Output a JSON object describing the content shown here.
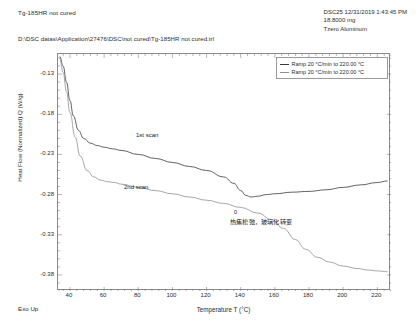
{
  "header": {
    "sample_title": "Tg-185HR not cured",
    "instrument_line": "DSC25 12/31/2019 1:43:45 PM",
    "mass_line": "18.8000 mg",
    "pan_line": "Tzero Aluminum",
    "file_path": "D:\\DSC datas\\Application\\27476\\DSC\\not cured\\Tg-185HR not cured.trl"
  },
  "legend": {
    "position": "top-right",
    "entries": [
      {
        "label": "Ramp 20 °C/min to 220.00 °C",
        "color": "#3a3a3a"
      },
      {
        "label": "Ramp 20 °C/min to 220.00 °C",
        "color": "#8f8f8f"
      }
    ]
  },
  "annotations": {
    "scan1": "1st scan",
    "scan2": "2nd scan",
    "zero_marker": "0",
    "chinese_note": "热焦松弛，玻璃化转变"
  },
  "footer": {
    "exo_up": "Exo Up"
  },
  "chart_data": {
    "type": "line",
    "title": "Tg-185HR not cured",
    "xlabel": "Temperature T (°C)",
    "ylabel": "Heat Flow (Normalized) Q (W/g)",
    "xlim": [
      33,
      228
    ],
    "ylim": [
      -0.4,
      -0.105
    ],
    "xticks": [
      40,
      60,
      80,
      100,
      120,
      140,
      160,
      180,
      200,
      220
    ],
    "yticks": [
      -0.13,
      -0.18,
      -0.23,
      -0.28,
      -0.33,
      -0.38
    ],
    "grid": false,
    "series": [
      {
        "name": "1st scan",
        "legend": "Ramp 20 °C/min to 220.00 °C",
        "color": "#3a3a3a",
        "x": [
          34,
          36,
          38,
          40,
          42,
          45,
          48,
          52,
          56,
          60,
          65,
          70,
          80,
          90,
          100,
          110,
          120,
          130,
          136,
          140,
          143,
          146,
          150,
          155,
          160,
          170,
          180,
          190,
          200,
          210,
          220,
          226
        ],
        "y": [
          -0.108,
          -0.12,
          -0.14,
          -0.163,
          -0.182,
          -0.2,
          -0.21,
          -0.216,
          -0.219,
          -0.221,
          -0.223,
          -0.225,
          -0.23,
          -0.235,
          -0.24,
          -0.245,
          -0.25,
          -0.258,
          -0.266,
          -0.275,
          -0.281,
          -0.283,
          -0.282,
          -0.28,
          -0.279,
          -0.277,
          -0.276,
          -0.274,
          -0.271,
          -0.268,
          -0.265,
          -0.263
        ]
      },
      {
        "name": "2nd scan",
        "legend": "Ramp 20 °C/min to 220.00 °C",
        "color": "#8f8f8f",
        "x": [
          34,
          36,
          38,
          40,
          43,
          46,
          50,
          54,
          58,
          62,
          66,
          70,
          80,
          90,
          100,
          110,
          120,
          130,
          140,
          150,
          158,
          165,
          172,
          178,
          185,
          192,
          200,
          208,
          215,
          220,
          226
        ],
        "y": [
          -0.11,
          -0.128,
          -0.152,
          -0.178,
          -0.208,
          -0.232,
          -0.25,
          -0.258,
          -0.262,
          -0.264,
          -0.265,
          -0.267,
          -0.271,
          -0.275,
          -0.279,
          -0.283,
          -0.287,
          -0.291,
          -0.296,
          -0.303,
          -0.311,
          -0.322,
          -0.336,
          -0.348,
          -0.358,
          -0.364,
          -0.369,
          -0.372,
          -0.374,
          -0.375,
          -0.376
        ]
      }
    ],
    "markers": [
      {
        "label": "0",
        "x": 141,
        "y": -0.281,
        "series": "1st scan"
      }
    ],
    "text_annotations": [
      {
        "text": "1st scan",
        "x": 97,
        "y": -0.185
      },
      {
        "text": "2nd scan",
        "x": 85,
        "y": -0.248
      },
      {
        "text": "热焦松弛，玻璃化转变",
        "x": 150,
        "y": -0.293
      }
    ]
  }
}
